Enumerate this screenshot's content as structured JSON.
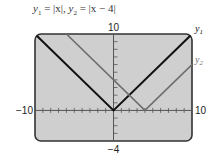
{
  "chart_data": {
    "type": "line",
    "title": "y1 = |x|,  y2 = |x − 4|",
    "title_parts": {
      "y1_label": "y",
      "y1_sub": "1",
      "eq1": " = |x|,  ",
      "y2_label": "y",
      "y2_sub": "2",
      "eq2": " = |x − 4|"
    },
    "xlabel": "",
    "ylabel": "",
    "xlim": [
      -10,
      10
    ],
    "ylim": [
      -4,
      10
    ],
    "x_tick_step": 1,
    "y_tick_step": 1,
    "window_labels": {
      "xmin": "−10",
      "xmax": "10",
      "ymin": "−4",
      "ymax": "10"
    },
    "grid": false,
    "legend": "right-edge labels",
    "series": [
      {
        "name": "y1",
        "label_main": "y",
        "label_sub": "1",
        "expression": "|x|",
        "color": "#111111",
        "x": [
          -10,
          0,
          10
        ],
        "y": [
          10,
          0,
          10
        ]
      },
      {
        "name": "y2",
        "label_main": "y",
        "label_sub": "2",
        "expression": "|x − 4|",
        "color": "#6e6e6e",
        "x": [
          -6,
          4,
          10
        ],
        "y": [
          10,
          0,
          6
        ]
      }
    ],
    "background_color": "#cfcfcf",
    "frame_color": "#333333"
  }
}
